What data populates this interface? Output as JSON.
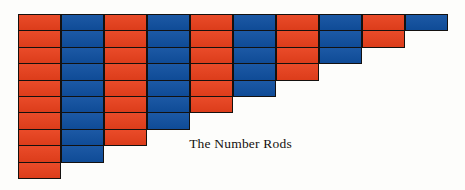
{
  "figure": {
    "caption": "The Number Rods",
    "background_color": "#fdfdfb",
    "outline_color": "#14110f"
  },
  "chart_data": {
    "type": "bar",
    "title": "The Number Rods",
    "xlabel": "",
    "ylabel": "",
    "orientation": "vertical",
    "grid": false,
    "legend": false,
    "unit": "segments",
    "ylim": [
      0,
      10
    ],
    "categories": [
      "1",
      "2",
      "3",
      "4",
      "5",
      "6",
      "7",
      "8",
      "9",
      "10"
    ],
    "values": [
      10,
      9,
      8,
      7,
      6,
      5,
      4,
      3,
      2,
      1
    ],
    "colors": [
      "#e8401c",
      "#1050a0",
      "#e8401c",
      "#1050a0",
      "#e8401c",
      "#1050a0",
      "#e8401c",
      "#1050a0",
      "#e8401c",
      "#1050a0"
    ],
    "color_names": [
      "red",
      "blue",
      "red",
      "blue",
      "red",
      "blue",
      "red",
      "blue",
      "red",
      "blue"
    ],
    "rods": [
      {
        "index": 1,
        "segments": 10,
        "color": "#e8401c",
        "color_name": "red"
      },
      {
        "index": 2,
        "segments": 9,
        "color": "#1050a0",
        "color_name": "blue"
      },
      {
        "index": 3,
        "segments": 8,
        "color": "#e8401c",
        "color_name": "red"
      },
      {
        "index": 4,
        "segments": 7,
        "color": "#1050a0",
        "color_name": "blue"
      },
      {
        "index": 5,
        "segments": 6,
        "color": "#e8401c",
        "color_name": "red"
      },
      {
        "index": 6,
        "segments": 5,
        "color": "#1050a0",
        "color_name": "blue"
      },
      {
        "index": 7,
        "segments": 4,
        "color": "#e8401c",
        "color_name": "red"
      },
      {
        "index": 8,
        "segments": 3,
        "color": "#1050a0",
        "color_name": "blue"
      },
      {
        "index": 9,
        "segments": 2,
        "color": "#e8401c",
        "color_name": "red"
      },
      {
        "index": 10,
        "segments": 1,
        "color": "#1050a0",
        "color_name": "blue"
      }
    ]
  },
  "layout": {
    "origin_x": 18,
    "origin_y": 14,
    "column_width": 43,
    "segment_height": 16.4
  }
}
